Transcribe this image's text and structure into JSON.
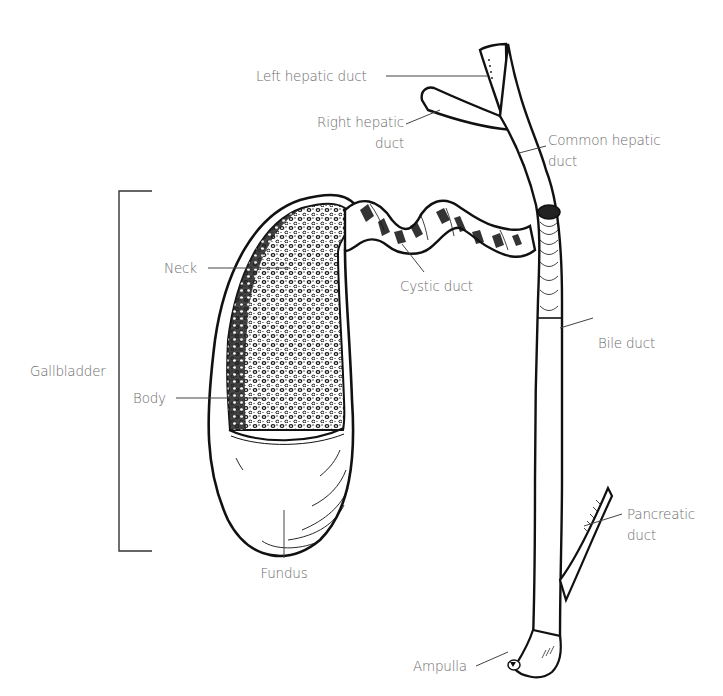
{
  "diagram": {
    "colors": {
      "ink": "#111111",
      "label": "#6b6b6b",
      "leader": "#444444",
      "background": "#ffffff"
    },
    "labels": {
      "left_hepatic_duct": "Left hepatic duct",
      "right_hepatic_duct_line1": "Right hepatic",
      "right_hepatic_duct_line2": "duct",
      "common_hepatic_duct_line1": "Common hepatic",
      "common_hepatic_duct_line2": "duct",
      "neck": "Neck",
      "cystic_duct": "Cystic duct",
      "gallbladder": "Gallbladder",
      "body": "Body",
      "bile_duct": "Bile duct",
      "pancreatic_duct_line1": "Pancreatic",
      "pancreatic_duct_line2": "duct",
      "fundus": "Fundus",
      "ampulla": "Ampulla"
    }
  }
}
